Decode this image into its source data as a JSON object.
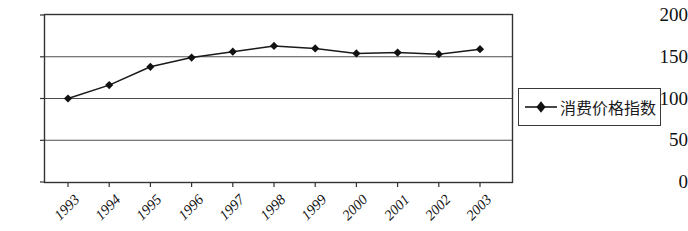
{
  "chart_data": {
    "type": "line",
    "title": "",
    "xlabel": "",
    "ylabel": "",
    "categories": [
      "1993",
      "1994",
      "1995",
      "1996",
      "1997",
      "1998",
      "1999",
      "2000",
      "2001",
      "2002",
      "2003"
    ],
    "series": [
      {
        "name": "消费价格指数",
        "values": [
          100,
          116,
          138,
          149,
          156,
          163,
          160,
          154,
          155,
          153,
          159
        ],
        "marker": "diamond",
        "color": "#1a1a1a"
      }
    ],
    "ylim": [
      0,
      200
    ],
    "y_ticks": [
      0,
      50,
      100,
      150,
      200
    ],
    "y_tick_labels": [
      "0",
      "50",
      "100",
      "150",
      "200"
    ],
    "grid": true,
    "grid_axis": "y",
    "legend_position": "right",
    "x_tick_label_rotation": -45
  },
  "legend": {
    "entries": [
      {
        "label": "消费价格指数",
        "marker_icon": "diamond-marker-icon"
      }
    ]
  },
  "colors": {
    "line": "#1a1a1a",
    "marker": "#111111",
    "grid": "#4d4d4d",
    "axis": "#333333",
    "background": "#ffffff"
  }
}
